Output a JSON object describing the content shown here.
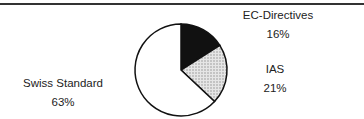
{
  "chart_data": {
    "type": "pie",
    "title": "",
    "categories": [
      "EC-Directives",
      "IAS",
      "Swiss Standard"
    ],
    "values": [
      16,
      21,
      63
    ],
    "labels": [
      {
        "name": "EC-Directives",
        "pct": "16%"
      },
      {
        "name": "IAS",
        "pct": "21%"
      },
      {
        "name": "Swiss Standard",
        "pct": "63%"
      }
    ],
    "fills": [
      "#111111",
      "#cfcfcf",
      "#ffffff"
    ],
    "start_angle_deg": 0,
    "direction": "clockwise",
    "legend": "none (direct labels)"
  }
}
